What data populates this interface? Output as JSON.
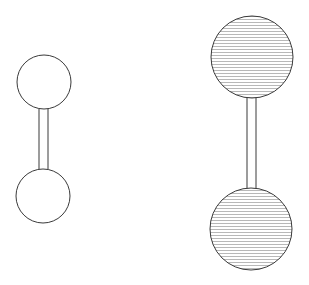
{
  "diagram": {
    "title": "",
    "stroke_color": "#3a3a3a",
    "fill_plain": "#ffffff",
    "hatch_color": "#8a8a8a",
    "objects": [
      {
        "name": "small-dumbbell",
        "hatched": false,
        "top_circle": {
          "cx": 44,
          "cy": 82,
          "r": 27
        },
        "bottom_circle": {
          "cx": 43,
          "cy": 196,
          "r": 27
        },
        "bar": {
          "x": 39,
          "y": 108,
          "w": 9,
          "h": 62
        }
      },
      {
        "name": "large-dumbbell",
        "hatched": true,
        "top_circle": {
          "cx": 252,
          "cy": 57,
          "r": 41
        },
        "bottom_circle": {
          "cx": 251,
          "cy": 229,
          "r": 41
        },
        "bar": {
          "x": 247,
          "y": 97,
          "w": 9,
          "h": 92
        }
      }
    ]
  }
}
